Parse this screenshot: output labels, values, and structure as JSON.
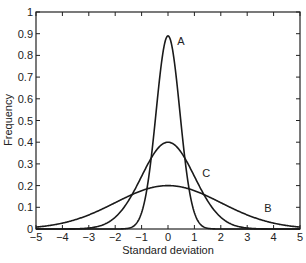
{
  "chart_data": {
    "type": "line",
    "title": "",
    "xlabel": "Standard deviation",
    "ylabel": "Frequency",
    "xlim": [
      -5,
      5
    ],
    "ylim": [
      0,
      1
    ],
    "grid": false,
    "legend": "none (curves labeled inline)",
    "x_ticks": [
      "-5",
      "-4",
      "-3",
      "-2",
      "-1",
      "0",
      "1",
      "2",
      "3",
      "4",
      "5"
    ],
    "y_ticks": [
      "0",
      "0.1",
      "0.2",
      "0.3",
      "0.4",
      "0.5",
      "0.6",
      "0.7",
      "0.8",
      "0.9",
      "1"
    ],
    "series": [
      {
        "name": "A",
        "distribution": "normal",
        "mean": 0,
        "sigma": 0.45,
        "peak": 0.89,
        "label_pos": [
          0.35,
          0.85
        ]
      },
      {
        "name": "B",
        "distribution": "normal",
        "mean": 0,
        "sigma": 2.0,
        "peak": 0.2,
        "label_pos": [
          3.65,
          0.08
        ]
      },
      {
        "name": "C",
        "distribution": "normal",
        "mean": 0,
        "sigma": 1.0,
        "peak": 0.4,
        "label_pos": [
          1.3,
          0.24
        ]
      }
    ],
    "annotations": [
      "A",
      "B",
      "C"
    ]
  }
}
